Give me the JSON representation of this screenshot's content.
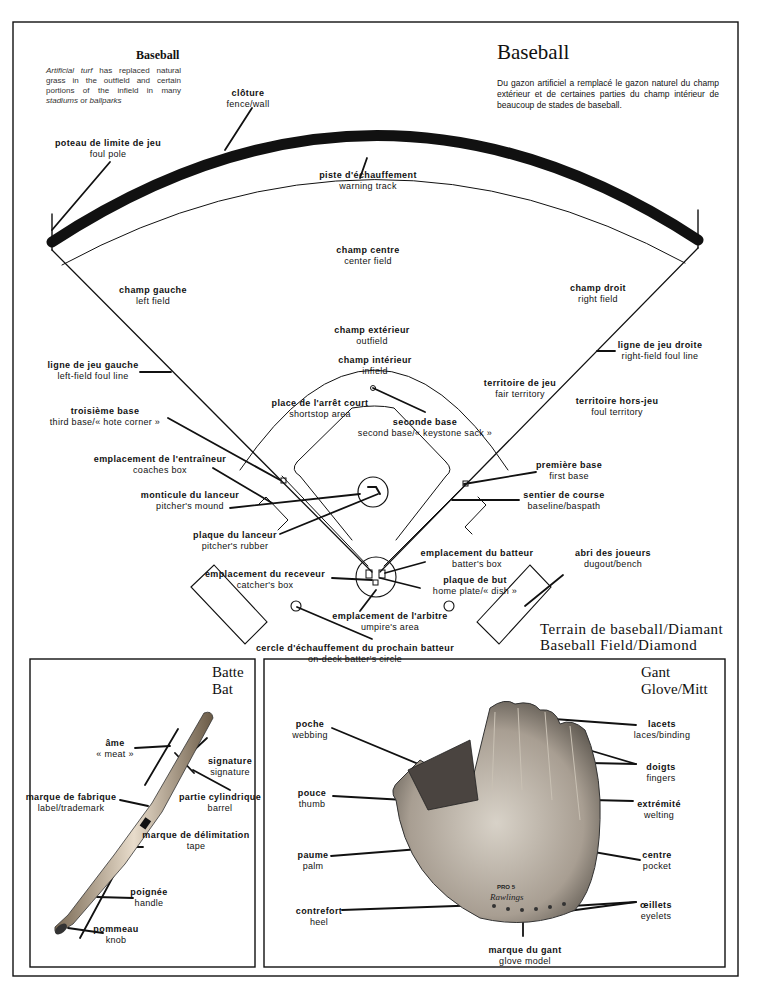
{
  "header": {
    "title_en": "Baseball",
    "note_en": [
      "Artificial turf",
      " has replaced natural grass in the outfield and certain portions of the infield in many ",
      "stadiums",
      " or ",
      "ballparks"
    ],
    "title_fr": "Baseball",
    "note_fr": "Du gazon artificiel a remplacé le gazon naturel du champ extérieur et de certaines parties du champ intérieur de beaucoup de stades de baseball."
  },
  "field": {
    "caption_fr": "Terrain de baseball/Diamant",
    "caption_en": "Baseball Field/Diamond",
    "labels": [
      {
        "id": "fence",
        "fr": "clôture",
        "en": "fence/wall",
        "x": 248,
        "y": 88
      },
      {
        "id": "foul-pole",
        "fr": "poteau de limite de jeu",
        "en": "foul pole",
        "x": 108,
        "y": 138
      },
      {
        "id": "warning-track",
        "fr": "piste d'échauffement",
        "en": "warning track",
        "x": 368,
        "y": 170
      },
      {
        "id": "center-field",
        "fr": "champ centre",
        "en": "center field",
        "x": 368,
        "y": 245
      },
      {
        "id": "left-field",
        "fr": "champ gauche",
        "en": "left field",
        "x": 153,
        "y": 285
      },
      {
        "id": "right-field",
        "fr": "champ droit",
        "en": "right field",
        "x": 598,
        "y": 283
      },
      {
        "id": "outfield",
        "fr": "champ extérieur",
        "en": "outfield",
        "x": 372,
        "y": 325
      },
      {
        "id": "infield",
        "fr": "champ intérieur",
        "en": "infield",
        "x": 375,
        "y": 355
      },
      {
        "id": "left-foul-line",
        "fr": "ligne de jeu gauche",
        "en": "left-field foul line",
        "x": 93,
        "y": 360
      },
      {
        "id": "right-foul-line",
        "fr": "ligne de jeu droite",
        "en": "right-field foul line",
        "x": 660,
        "y": 340
      },
      {
        "id": "fair-territory",
        "fr": "territoire de jeu",
        "en": "fair territory",
        "x": 520,
        "y": 378
      },
      {
        "id": "foul-territory",
        "fr": "territoire hors-jeu",
        "en": "foul territory",
        "x": 617,
        "y": 396
      },
      {
        "id": "shortstop",
        "fr": "place de l'arrêt court",
        "en": "shortstop area",
        "x": 320,
        "y": 398
      },
      {
        "id": "third-base",
        "fr": "troisième base",
        "en": "third base/« hote corner »",
        "x": 105,
        "y": 406
      },
      {
        "id": "second-base",
        "fr": "seconde base",
        "en": "second base/« keystone sack »",
        "x": 425,
        "y": 417
      },
      {
        "id": "coaches-box",
        "fr": "emplacement de l'entraîneur",
        "en": "coaches box",
        "x": 160,
        "y": 454
      },
      {
        "id": "first-base",
        "fr": "première base",
        "en": "first base",
        "x": 569,
        "y": 460
      },
      {
        "id": "pitchers-mound",
        "fr": "monticule du lanceur",
        "en": "pitcher's mound",
        "x": 190,
        "y": 490
      },
      {
        "id": "baseline",
        "fr": "sentier de course",
        "en": "baseline/baspath",
        "x": 564,
        "y": 490
      },
      {
        "id": "pitchers-rubber",
        "fr": "plaque du lanceur",
        "en": "pitcher's rubber",
        "x": 235,
        "y": 530
      },
      {
        "id": "batters-box",
        "fr": "emplacement du batteur",
        "en": "batter's box",
        "x": 477,
        "y": 548
      },
      {
        "id": "dugout",
        "fr": "abri des joueurs",
        "en": "dugout/bench",
        "x": 613,
        "y": 548
      },
      {
        "id": "catchers-box",
        "fr": "emplacement du receveur",
        "en": "catcher's box",
        "x": 265,
        "y": 569
      },
      {
        "id": "home-plate",
        "fr": "plaque de but",
        "en": "home plate/« dish »",
        "x": 475,
        "y": 575
      },
      {
        "id": "umpire",
        "fr": "emplacement de l'arbitre",
        "en": "umpire's area",
        "x": 390,
        "y": 611
      },
      {
        "id": "on-deck",
        "fr": "cercle d'échauffement du prochain batteur",
        "en": "on-deck batter's circle",
        "x": 355,
        "y": 643
      }
    ]
  },
  "bat": {
    "title_fr": "Batte",
    "title_en": "Bat",
    "labels": [
      {
        "id": "meat",
        "fr": "âme",
        "en": "« meat »",
        "x": 115,
        "y": 738
      },
      {
        "id": "signature",
        "fr": "signature",
        "en": "signature",
        "x": 230,
        "y": 756
      },
      {
        "id": "trademark",
        "fr": "marque de fabrique",
        "en": "label/trademark",
        "x": 71,
        "y": 792
      },
      {
        "id": "barrel",
        "fr": "partie cylindrique",
        "en": "barrel",
        "x": 220,
        "y": 792
      },
      {
        "id": "tape",
        "fr": "marque de délimitation",
        "en": "tape",
        "x": 196,
        "y": 830
      },
      {
        "id": "handle",
        "fr": "poignée",
        "en": "handle",
        "x": 149,
        "y": 887
      },
      {
        "id": "knob",
        "fr": "pommeau",
        "en": "knob",
        "x": 116,
        "y": 924
      }
    ]
  },
  "glove": {
    "title_fr": "Gant",
    "title_en": "Glove/Mitt",
    "labels": [
      {
        "id": "webbing",
        "fr": "poche",
        "en": "webbing",
        "x": 310,
        "y": 719
      },
      {
        "id": "laces",
        "fr": "lacets",
        "en": "laces/binding",
        "x": 662,
        "y": 719
      },
      {
        "id": "fingers",
        "fr": "doigts",
        "en": "fingers",
        "x": 661,
        "y": 762
      },
      {
        "id": "thumb",
        "fr": "pouce",
        "en": "thumb",
        "x": 312,
        "y": 788
      },
      {
        "id": "welting",
        "fr": "extrémité",
        "en": "welting",
        "x": 659,
        "y": 799
      },
      {
        "id": "palm",
        "fr": "paume",
        "en": "palm",
        "x": 313,
        "y": 850
      },
      {
        "id": "pocket",
        "fr": "centre",
        "en": "pocket",
        "x": 657,
        "y": 850
      },
      {
        "id": "heel",
        "fr": "contrefort",
        "en": "heel",
        "x": 319,
        "y": 906
      },
      {
        "id": "eyelets",
        "fr": "œillets",
        "en": "eyelets",
        "x": 656,
        "y": 900
      },
      {
        "id": "glove-model",
        "fr": "marque du gant",
        "en": "glove model",
        "x": 525,
        "y": 945
      }
    ],
    "imprint": {
      "model": "PRO 5",
      "brand": "Rawlings"
    }
  }
}
